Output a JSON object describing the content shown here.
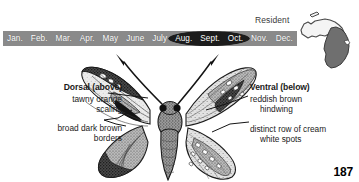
{
  "page": {
    "number": "187",
    "background_color": "#ffffff"
  },
  "phenology": {
    "bar_color": "#8a8a8a",
    "flight_period_color": "#1c1c1c",
    "months": [
      "Jan.",
      "Feb.",
      "Mar.",
      "Apr.",
      "May",
      "June",
      "July",
      "Aug.",
      "Sept.",
      "Oct.",
      "Nov.",
      "Dec."
    ],
    "flight_period_months": [
      "Aug.",
      "Sept.",
      "Oct."
    ],
    "flight_period_start_month": "July",
    "flight_period_end_month": "Nov."
  },
  "range_map": {
    "status_label": "Resident",
    "state": "Michigan",
    "upper_peninsula_fill": "#f2f2f2",
    "lower_peninsula_fill": "#6f6f6f"
  },
  "annotations": {
    "left": {
      "heading": "Dorsal (above)",
      "line1": "tawny orange",
      "line2": "scaling",
      "line3": "broad dark brown",
      "line4": "borders"
    },
    "right": {
      "heading": "Ventral (below)",
      "line1": "reddish brown",
      "line2": "hindwing",
      "line3": "distinct row of cream",
      "line4": "white spots"
    }
  },
  "illustration": {
    "subject": "butterfly-specimen",
    "left_wing_view": "dorsal",
    "right_wing_view": "ventral",
    "ink_color": "#262626"
  }
}
